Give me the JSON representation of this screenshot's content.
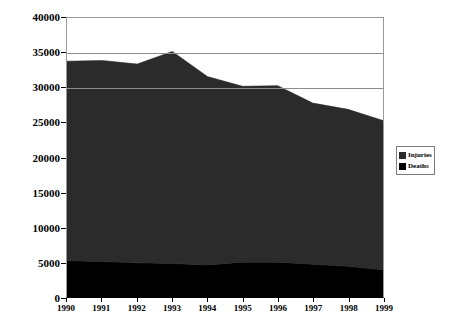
{
  "chart_data": {
    "type": "area",
    "stacked": true,
    "title": "",
    "subtitle": "",
    "xlabel": "",
    "ylabel": "",
    "categories": [
      "1990",
      "1991",
      "1992",
      "1993",
      "1994",
      "1995",
      "1996",
      "1997",
      "1998",
      "1999"
    ],
    "x": [
      1990,
      1991,
      1992,
      1993,
      1994,
      1995,
      1996,
      1997,
      1998,
      1999
    ],
    "series": [
      {
        "name": "Injuries",
        "color": "#2b2b2b",
        "values": [
          28600,
          28800,
          28500,
          30400,
          27000,
          25200,
          25300,
          23100,
          22500,
          21400
        ]
      },
      {
        "name": "Deaths",
        "color": "#000000",
        "values": [
          5200,
          5100,
          4900,
          4800,
          4600,
          5000,
          5000,
          4700,
          4400,
          3900
        ]
      }
    ],
    "stack_totals": [
      33800,
      33900,
      33400,
      35200,
      31600,
      30200,
      30300,
      27800,
      26900,
      25300
    ],
    "ylim": [
      0,
      40000
    ],
    "xlim": [
      1990,
      1999
    ],
    "ytick_values": [
      0,
      5000,
      10000,
      15000,
      20000,
      25000,
      30000,
      35000,
      40000
    ],
    "ytick_labels": [
      "0",
      "5000",
      "10000",
      "15000",
      "20000",
      "25000",
      "30000",
      "35000",
      "40000"
    ],
    "gridlines": {
      "visible": true,
      "at": [
        30000,
        35000,
        40000
      ],
      "color": "#8c8c8c"
    },
    "legend": {
      "position": "right",
      "entries": [
        {
          "label": "Injuries",
          "color": "#2b2b2b"
        },
        {
          "label": "Deaths",
          "color": "#000000"
        }
      ]
    },
    "axis_color": "#000000",
    "plot_background": "#ffffff"
  }
}
